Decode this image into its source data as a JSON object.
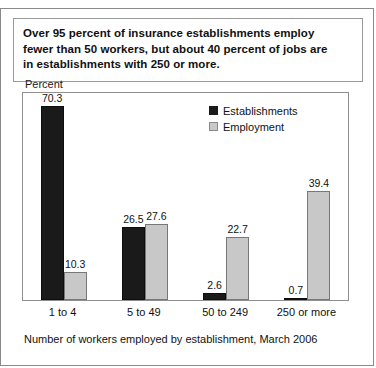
{
  "title": {
    "line1": "Over 95 percent of insurance establishments employ",
    "line2": "fewer than 50 workers, but about 40 percent of jobs are",
    "line3": "in establishments with 250 or more."
  },
  "axis": {
    "y_label": "Percent",
    "x_caption": "Number of workers employed by establishment, March 2006"
  },
  "legend": {
    "items": [
      {
        "label": "Establishments",
        "color": "#1a1a1a"
      },
      {
        "label": "Employment",
        "color": "#c8c8c8"
      }
    ]
  },
  "chart_data": {
    "type": "bar",
    "title": "Over 95 percent of insurance establishments employ fewer than 50 workers, but about 40 percent of jobs are in establishments with 250 or more.",
    "xlabel": "Number of workers employed by establishment, March 2006",
    "ylabel": "Percent",
    "ylim": [
      0,
      75
    ],
    "grid": false,
    "legend_position": "top-right-inside",
    "categories": [
      "1 to 4",
      "5 to 49",
      "50 to 249",
      "250 or more"
    ],
    "series": [
      {
        "name": "Establishments",
        "color": "#1a1a1a",
        "values": [
          70.3,
          26.5,
          2.6,
          0.7
        ]
      },
      {
        "name": "Employment",
        "color": "#c8c8c8",
        "values": [
          10.3,
          27.6,
          22.7,
          39.4
        ]
      }
    ]
  }
}
